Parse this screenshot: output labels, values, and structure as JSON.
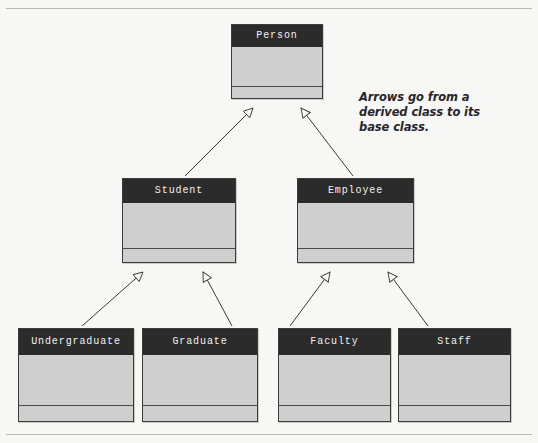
{
  "diagram": {
    "type": "uml-class-inheritance",
    "background_color": "#f7f7f5",
    "header_color": "#2b2b2b",
    "body_color": "#cfcfcf",
    "border_color": "#3b3b3b",
    "line_color": "#3a3a3a"
  },
  "classes": [
    {
      "id": "person",
      "name": "Person",
      "level": 1
    },
    {
      "id": "student",
      "name": "Student",
      "level": 2
    },
    {
      "id": "employee",
      "name": "Employee",
      "level": 2
    },
    {
      "id": "undergraduate",
      "name": "Undergraduate",
      "level": 3
    },
    {
      "id": "graduate",
      "name": "Graduate",
      "level": 3
    },
    {
      "id": "faculty",
      "name": "Faculty",
      "level": 3
    },
    {
      "id": "staff",
      "name": "Staff",
      "level": 3
    }
  ],
  "relationships": [
    {
      "from": "student",
      "to": "person",
      "type": "generalization"
    },
    {
      "from": "employee",
      "to": "person",
      "type": "generalization"
    },
    {
      "from": "undergraduate",
      "to": "student",
      "type": "generalization"
    },
    {
      "from": "graduate",
      "to": "student",
      "type": "generalization"
    },
    {
      "from": "faculty",
      "to": "employee",
      "type": "generalization"
    },
    {
      "from": "staff",
      "to": "employee",
      "type": "generalization"
    }
  ],
  "annotation": {
    "line1": "Arrows go from a",
    "line2": "derived class to its",
    "line3": "base class."
  }
}
